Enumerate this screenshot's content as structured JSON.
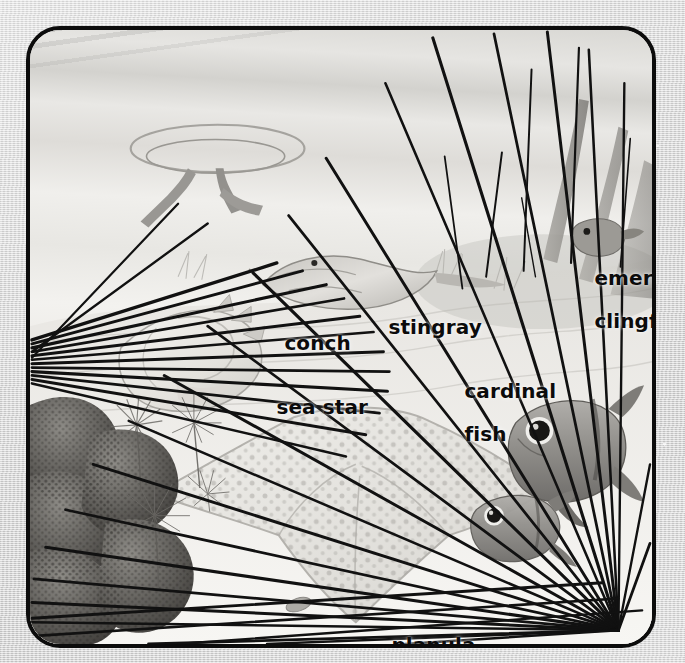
{
  "figure": {
    "kind": "labeled-illustration",
    "palette": {
      "frame_border": "#0c0c0c",
      "page_background": "#d6d6d6",
      "label_text": "#0b0b0b",
      "spine_color": "#111111",
      "water": "#eceae6",
      "sand": "#f3f2ef",
      "coral_dark": "#555350"
    }
  },
  "labels": [
    {
      "id": "emerald-clingfish",
      "text_line1": "emerald",
      "text_line2": "clingfish",
      "x": 548,
      "y": 243,
      "size": 20,
      "align": "left"
    },
    {
      "id": "stingray",
      "text_line1": "stingray",
      "text_line2": "",
      "x": 342,
      "y": 292,
      "size": 20,
      "align": "left"
    },
    {
      "id": "conch",
      "text_line1": "conch",
      "text_line2": "",
      "x": 238,
      "y": 308,
      "size": 20,
      "align": "left"
    },
    {
      "id": "cardinal-fish",
      "text_line1": "cardinal",
      "text_line2": "fish",
      "x": 418,
      "y": 356,
      "size": 20,
      "align": "left"
    },
    {
      "id": "sea-star",
      "text_line1": "sea star",
      "text_line2": "",
      "x": 230,
      "y": 372,
      "size": 20,
      "align": "left"
    },
    {
      "id": "planula",
      "text_line1": "planula",
      "text_line2": "",
      "x": 345,
      "y": 610,
      "size": 20,
      "align": "left"
    }
  ],
  "organisms": [
    {
      "name": "emerald clingfish",
      "note": "small fish on seagrass blade, upper right"
    },
    {
      "name": "stingray",
      "note": "ray gliding over sand, upper middle"
    },
    {
      "name": "conch",
      "note": "large shell left of centre"
    },
    {
      "name": "cardinal fish",
      "note": "two fish with large dark eyes, right"
    },
    {
      "name": "sea star",
      "note": "dotted starfish centre-bottom"
    },
    {
      "name": "planula",
      "note": "tiny coral larva, bottom centre"
    },
    {
      "name": "sea urchin spines",
      "note": "long black spines radiating across scene"
    },
    {
      "name": "brain coral",
      "note": "mounded coral, lower left"
    },
    {
      "name": "feather duster worms",
      "note": "fan-like tufts, lower left"
    }
  ]
}
